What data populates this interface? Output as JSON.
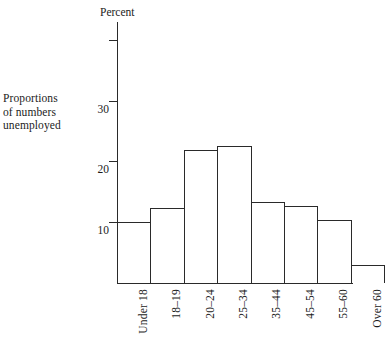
{
  "side_caption": {
    "line1": "Proportions",
    "line2": "of numbers",
    "line3": "unemployed"
  },
  "axis_title": "Percent",
  "chart_data": {
    "type": "bar",
    "title": "",
    "subtitle": "",
    "xlabel": "",
    "ylabel": "Percent",
    "side_label": "Proportions of numbers unemployed",
    "categories": [
      "Under 18",
      "18–19",
      "20–24",
      "25–34",
      "35–44",
      "45–54",
      "55–60",
      "Over 60"
    ],
    "values": [
      10.0,
      12.3,
      21.8,
      22.6,
      13.4,
      12.7,
      10.4,
      3.0
    ],
    "ylim": [
      0,
      40
    ],
    "yticks": [
      10,
      20,
      30,
      40
    ],
    "ytick_labels": [
      "10",
      "20",
      "30",
      ""
    ],
    "grid": false,
    "legend": null,
    "bar_style": "outline",
    "bar_edge_color": "#2a2a2a",
    "bar_fill_color": "#ffffff",
    "axis_color": "#2a2a2a",
    "background_color": "#ffffff"
  }
}
